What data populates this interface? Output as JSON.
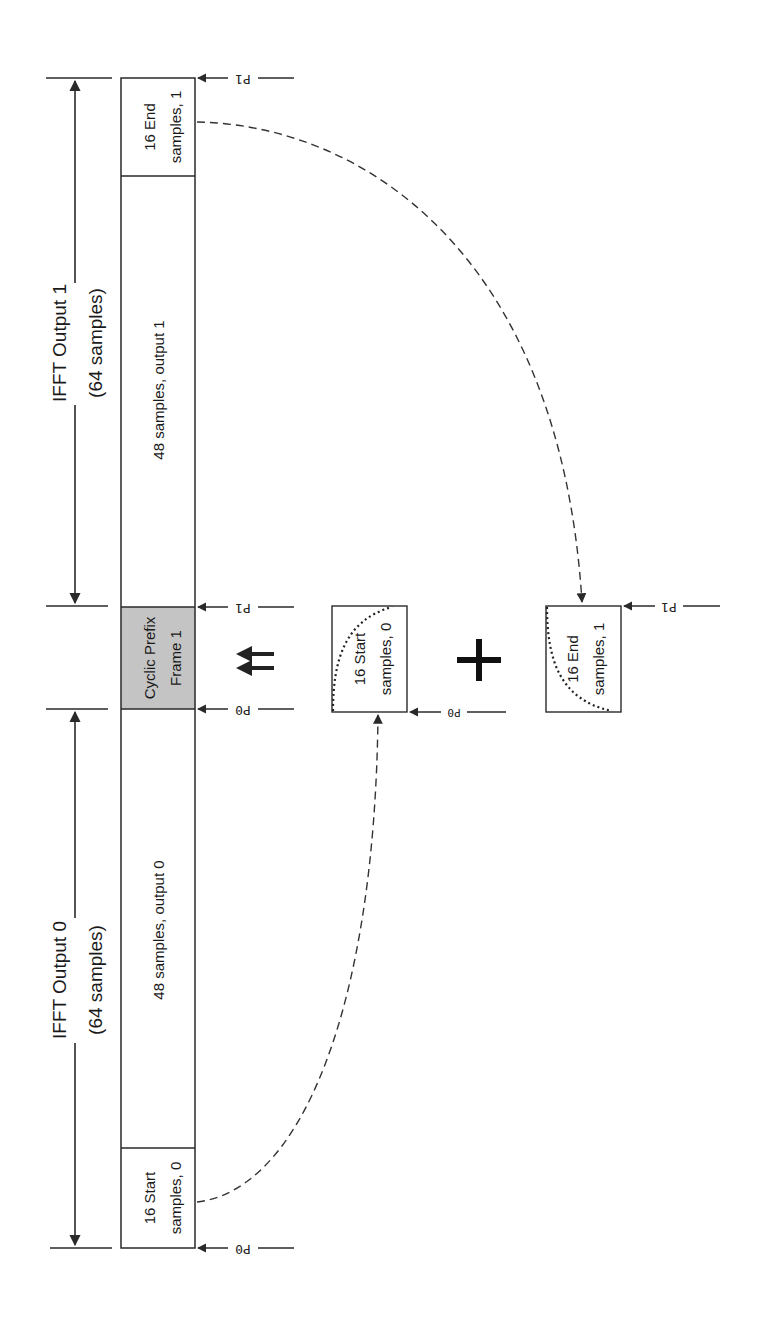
{
  "diagram": {
    "title_hint": "Cyclic prefix construction for frame 1 from IFFT outputs",
    "colors": {
      "line": "#2a2a2a",
      "cyclic_prefix_fill": "#c4c4c4",
      "background": "#ffffff"
    },
    "dimensions": {
      "output1": {
        "line1": "IFFT Output 1",
        "line2": "(64 samples)"
      },
      "output0": {
        "line1": "IFFT Output 0",
        "line2": "(64 samples)"
      }
    },
    "strip": {
      "segments": [
        {
          "id": "end1",
          "line1": "16 End",
          "line2": "samples, 1"
        },
        {
          "id": "mid1",
          "line1": "48 samples, output 1"
        },
        {
          "id": "cp1",
          "line1": "Cyclic Prefix",
          "line2": "Frame 1"
        },
        {
          "id": "mid0",
          "line1": "48 samples, output 0"
        },
        {
          "id": "start0",
          "line1": "16 Start",
          "line2": "samples, 0"
        }
      ]
    },
    "markers": {
      "p0": "P0",
      "p1": "P1"
    },
    "operators": {
      "equals": "⇇",
      "plus": "+"
    },
    "window_boxes": [
      {
        "id": "start0-window",
        "line1": "16 Start",
        "line2": "samples, 0"
      },
      {
        "id": "end1-window",
        "line1": "16 End",
        "line2": "samples, 1"
      }
    ]
  }
}
